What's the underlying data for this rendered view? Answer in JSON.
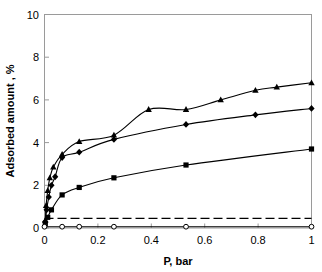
{
  "chart_data": {
    "type": "line",
    "title": "",
    "xlabel": "P, bar",
    "ylabel": "Adsorbed amount , %",
    "xlim": [
      0,
      1
    ],
    "ylim": [
      0,
      10
    ],
    "xticks": [
      "0",
      "0.2",
      "0.4",
      "0.6",
      "0.8",
      "1"
    ],
    "xtick_values": [
      0,
      0.2,
      0.4,
      0.6,
      0.8,
      1
    ],
    "yticks": [
      "0",
      "2",
      "4",
      "6",
      "8",
      "10"
    ],
    "ytick_values": [
      0,
      2,
      4,
      6,
      8,
      10
    ],
    "grid": false,
    "legend": null,
    "series": [
      {
        "name": "triangle-series",
        "marker": "triangle",
        "color": "#000000",
        "line": "solid",
        "x": [
          0.003,
          0.006,
          0.012,
          0.02,
          0.033,
          0.066,
          0.13,
          0.26,
          0.39,
          0.53,
          0.66,
          0.79,
          0.87,
          1.0
        ],
        "y": [
          0.35,
          1.05,
          1.75,
          2.35,
          2.85,
          3.45,
          4.05,
          4.35,
          5.55,
          5.55,
          6.0,
          6.45,
          6.6,
          6.8
        ]
      },
      {
        "name": "diamond-series",
        "marker": "diamond",
        "color": "#000000",
        "line": "solid",
        "x": [
          0.003,
          0.008,
          0.016,
          0.026,
          0.04,
          0.066,
          0.13,
          0.26,
          0.53,
          0.79,
          1.0
        ],
        "y": [
          0.3,
          0.85,
          1.45,
          2.0,
          2.4,
          3.3,
          3.55,
          4.15,
          4.85,
          5.3,
          5.6
        ]
      },
      {
        "name": "square-series",
        "marker": "square",
        "color": "#000000",
        "line": "solid",
        "x": [
          0.003,
          0.012,
          0.026,
          0.066,
          0.13,
          0.26,
          0.53,
          1.0
        ],
        "y": [
          0.2,
          0.5,
          0.85,
          1.55,
          1.9,
          2.35,
          2.95,
          3.7
        ]
      },
      {
        "name": "dashed-flat-series",
        "marker": "none",
        "color": "#000000",
        "line": "dashed",
        "x": [
          0.0,
          0.066,
          0.13,
          0.26,
          0.53,
          1.0
        ],
        "y": [
          0.45,
          0.45,
          0.45,
          0.45,
          0.45,
          0.45
        ]
      },
      {
        "name": "open-circle-flat-series",
        "marker": "open-circle",
        "color": "#000000",
        "line": "solid",
        "x": [
          0.0,
          0.066,
          0.13,
          0.26,
          0.53,
          1.0
        ],
        "y": [
          0.06,
          0.06,
          0.06,
          0.06,
          0.06,
          0.06
        ]
      }
    ]
  },
  "axes": {
    "x_title": "P, bar",
    "y_title": "Adsorbed amount , %"
  }
}
